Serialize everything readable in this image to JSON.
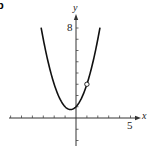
{
  "panel_label": "b",
  "chart_data": {
    "type": "line",
    "title": "",
    "xlabel": "x",
    "ylabel": "y",
    "function": "y = x^2 + x + 1",
    "xlim": [
      -6,
      5.5
    ],
    "ylim": [
      -3,
      8.5
    ],
    "x_tick_step": 1,
    "y_tick_step": 1,
    "x_tick_labels": [
      {
        "value": 5,
        "label": "5"
      }
    ],
    "y_tick_labels": [
      {
        "value": 8,
        "label": "8"
      }
    ],
    "series": [
      {
        "name": "parabola",
        "x": [
          -3.2,
          -3,
          -2.5,
          -2,
          -1.5,
          -1,
          -0.5,
          0,
          0.5,
          1,
          1.5,
          2,
          2.2
        ],
        "y": [
          8.04,
          7,
          4.75,
          3,
          1.75,
          1,
          0.75,
          1,
          1.75,
          3,
          4.75,
          7,
          8.04
        ]
      }
    ],
    "annotations": [
      {
        "type": "open_circle",
        "x": 1,
        "y": 3
      }
    ],
    "grid": false,
    "legend": null
  }
}
